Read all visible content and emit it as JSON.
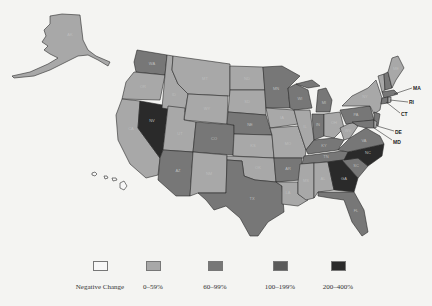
{
  "map": {
    "type": "choropleth",
    "region": "United States",
    "colors": {
      "negative": "#f7f7f7",
      "c0_59": "#a8a8a8",
      "c60_99": "#777777",
      "c100_199": "#5a5a5a",
      "c200_400": "#2a2a2a"
    },
    "callouts": [
      "MA",
      "RI",
      "CT",
      "DE",
      "MD"
    ]
  },
  "legend": {
    "items": [
      {
        "label": "Negative Change",
        "color": "#f7f7f7"
      },
      {
        "label": "0–59%",
        "color": "#a8a8a8"
      },
      {
        "label": "60–99%",
        "color": "#777777"
      },
      {
        "label": "100–199%",
        "color": "#5a5a5a"
      },
      {
        "label": "200–400%",
        "color": "#2a2a2a"
      }
    ]
  }
}
